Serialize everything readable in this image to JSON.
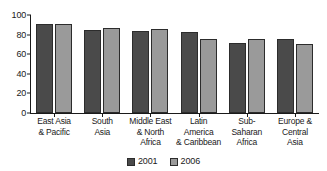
{
  "chart_data": {
    "type": "bar",
    "title": "",
    "xlabel": "",
    "ylabel": "",
    "ylim": [
      0,
      100
    ],
    "yticks": [
      0,
      20,
      40,
      60,
      80,
      100
    ],
    "grid": false,
    "legend_position": "bottom-center",
    "categories": [
      "East Asia\n& Pacific",
      "South\nAsia",
      "Middle East\n& North\nAfrica",
      "Latin\nAmerica\n& Caribbean",
      "Sub-Saharan\nAfrica",
      "Europe &\nCentral\nAsia"
    ],
    "series": [
      {
        "name": "2001",
        "color": "#4a4a4a",
        "values": [
          91,
          85,
          84,
          83,
          71,
          76
        ]
      },
      {
        "name": "2006",
        "color": "#9a9a9a",
        "values": [
          91,
          87,
          86,
          76,
          76,
          70
        ]
      }
    ]
  },
  "top_sliver_text": "",
  "legend": {
    "items": [
      {
        "label": "2001"
      },
      {
        "label": "2006"
      }
    ]
  }
}
